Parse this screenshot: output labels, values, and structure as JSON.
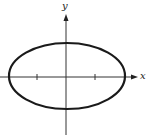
{
  "figure": {
    "type": "ellipse-on-axes",
    "axes": {
      "x_label": "x",
      "y_label": "y",
      "origin_px": [
        66,
        77
      ],
      "tick_marks_x_px": [
        37,
        95
      ]
    },
    "ellipse": {
      "center_px": [
        67,
        76
      ],
      "rx_px": 58,
      "ry_px": 33,
      "stroke": "#1a1a1a",
      "stroke_width": 2.2
    },
    "colors": {
      "axis": "#333333",
      "curve": "#1a1a1a",
      "background": "#ffffff"
    }
  }
}
